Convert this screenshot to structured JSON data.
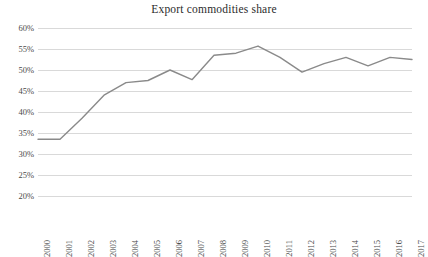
{
  "chart_data": {
    "type": "line",
    "title": "Export commodities share",
    "xlabel": "",
    "ylabel": "",
    "grid": true,
    "legend": "none",
    "line_color": "#8a8a8a",
    "gridline_color": "#d9d9d9",
    "ylim": [
      20,
      60
    ],
    "ytick_labels": [
      "60%",
      "55%",
      "50%",
      "45%",
      "40%",
      "35%",
      "30%",
      "25%",
      "20%"
    ],
    "yticks": [
      60,
      55,
      50,
      45,
      40,
      35,
      30,
      25,
      20
    ],
    "categories": [
      "2000",
      "2001",
      "2002",
      "2003",
      "2004",
      "2005",
      "2006",
      "2007",
      "2008",
      "2009",
      "2010",
      "2011",
      "2012",
      "2013",
      "2014",
      "2015",
      "2016",
      "2017"
    ],
    "values": [
      33.5,
      33.5,
      38.5,
      44.0,
      47.0,
      47.5,
      50.0,
      47.7,
      53.5,
      54.0,
      55.7,
      53.0,
      49.5,
      51.5,
      53.0,
      51.0,
      53.0,
      52.5
    ],
    "series": [
      {
        "name": "Export commodities share",
        "values": [
          33.5,
          33.5,
          38.5,
          44.0,
          47.0,
          47.5,
          50.0,
          47.7,
          53.5,
          54.0,
          55.7,
          53.0,
          49.5,
          51.5,
          53.0,
          51.0,
          53.0,
          52.5
        ]
      }
    ]
  }
}
